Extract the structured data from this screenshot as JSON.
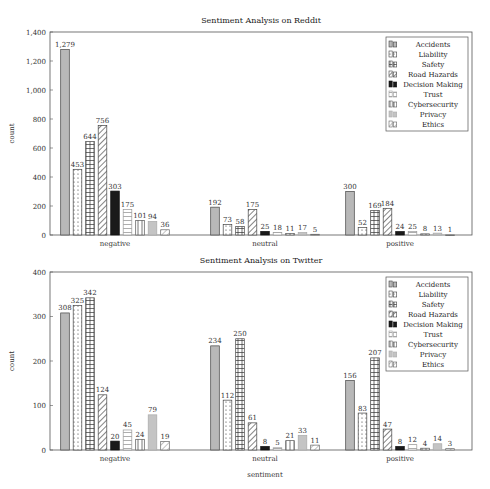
{
  "chart_data": [
    {
      "type": "bar",
      "title": "Sentiment Analysis on Reddit",
      "xlabel": "",
      "ylabel": "count",
      "ylim": [
        0,
        1400
      ],
      "yticks": [
        "0",
        "200",
        "400",
        "600",
        "800",
        "1,000",
        "1,200",
        "1,400"
      ],
      "categories": [
        "negative",
        "neutral",
        "positive"
      ],
      "legend_position": "upper right",
      "series": [
        {
          "name": "Accidents",
          "values": [
            1279,
            192,
            300
          ],
          "labels": [
            "1,279",
            "192",
            "300"
          ]
        },
        {
          "name": "Liability",
          "values": [
            453,
            73,
            52
          ],
          "labels": [
            "453",
            "73",
            "52"
          ]
        },
        {
          "name": "Safety",
          "values": [
            644,
            58,
            169
          ],
          "labels": [
            "644",
            "58",
            "169"
          ]
        },
        {
          "name": "Road Hazards",
          "values": [
            756,
            175,
            184
          ],
          "labels": [
            "756",
            "175",
            "184"
          ]
        },
        {
          "name": "Decision Making",
          "values": [
            303,
            25,
            24
          ],
          "labels": [
            "303",
            "25",
            "24"
          ]
        },
        {
          "name": "Trust",
          "values": [
            175,
            18,
            25
          ],
          "labels": [
            "175",
            "18",
            "25"
          ]
        },
        {
          "name": "Cybersecurity",
          "values": [
            101,
            11,
            8
          ],
          "labels": [
            "101",
            "11",
            "8"
          ]
        },
        {
          "name": "Privacy",
          "values": [
            94,
            17,
            13
          ],
          "labels": [
            "94",
            "17",
            "13"
          ]
        },
        {
          "name": "Ethics",
          "values": [
            36,
            5,
            1
          ],
          "labels": [
            "36",
            "5",
            "1"
          ]
        }
      ]
    },
    {
      "type": "bar",
      "title": "Sentiment Analysis on Twitter",
      "xlabel": "sentiment",
      "ylabel": "count",
      "ylim": [
        0,
        400
      ],
      "yticks": [
        "0",
        "100",
        "200",
        "300",
        "400"
      ],
      "categories": [
        "negative",
        "neutral",
        "positive"
      ],
      "legend_position": "upper right",
      "series": [
        {
          "name": "Accidents",
          "values": [
            308,
            234,
            156
          ],
          "labels": [
            "308",
            "234",
            "156"
          ]
        },
        {
          "name": "Liability",
          "values": [
            325,
            112,
            83
          ],
          "labels": [
            "325",
            "112",
            "83"
          ]
        },
        {
          "name": "Safety",
          "values": [
            342,
            250,
            207
          ],
          "labels": [
            "342",
            "250",
            "207"
          ]
        },
        {
          "name": "Road Hazards",
          "values": [
            124,
            61,
            47
          ],
          "labels": [
            "124",
            "61",
            "47"
          ]
        },
        {
          "name": "Decision Making",
          "values": [
            20,
            8,
            8
          ],
          "labels": [
            "20",
            "8",
            "8"
          ]
        },
        {
          "name": "Trust",
          "values": [
            45,
            5,
            12
          ],
          "labels": [
            "45",
            "5",
            "12"
          ]
        },
        {
          "name": "Cybersecurity",
          "values": [
            24,
            21,
            4
          ],
          "labels": [
            "24",
            "21",
            "4"
          ]
        },
        {
          "name": "Privacy",
          "values": [
            79,
            33,
            14
          ],
          "labels": [
            "79",
            "33",
            "14"
          ]
        },
        {
          "name": "Ethics",
          "values": [
            19,
            11,
            3
          ],
          "labels": [
            "19",
            "11",
            "3"
          ]
        }
      ]
    }
  ],
  "colors": {
    "axis": "#555555",
    "text": "#222222",
    "accidents": "#b8b8b8",
    "decision_making": "#1a1a1a",
    "privacy": "#c4c4c4"
  }
}
